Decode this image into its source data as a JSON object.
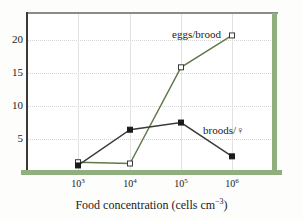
{
  "chart_data": {
    "type": "line",
    "title": "",
    "xlabel": "Food concentration (cells cm",
    "xlabel_exponent": "−3",
    "xlabel_close": ")",
    "ylabel": "",
    "x_categories": [
      "10^3",
      "10^4",
      "10^5",
      "10^6"
    ],
    "x_tick_mantissa": "10",
    "x_tick_exponents": [
      "3",
      "4",
      "5",
      "6"
    ],
    "y_ticks": [
      20,
      15,
      10,
      5
    ],
    "ylim": [
      0,
      23.5
    ],
    "grid": true,
    "legend_position": "inline-annotation",
    "series": [
      {
        "name": "eggs/brood",
        "marker": "open-square",
        "color": "#5f7a4a",
        "values": [
          1.2,
          1.0,
          15.8,
          20.7
        ]
      },
      {
        "name": "broods/♀",
        "marker": "filled-square",
        "color": "#3a3a3a",
        "values": [
          0.7,
          6.2,
          7.3,
          2.1
        ]
      }
    ],
    "annotations": [
      {
        "text": "eggs/brood",
        "series": "eggs/brood"
      },
      {
        "text": "broods/♀",
        "series": "broods/♀"
      }
    ],
    "colors": {
      "accent_green": "#8fb07e",
      "line_green": "#5f7a4a",
      "line_dark": "#3a3a3a",
      "grid": "#d6d6d6",
      "frame_top": "#8a8a8a"
    }
  }
}
